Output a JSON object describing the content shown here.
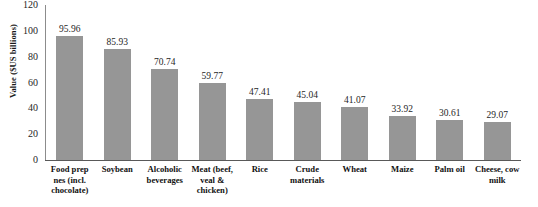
{
  "chart_data": {
    "type": "bar",
    "title": "",
    "xlabel": "",
    "ylabel": "Value ($US billions)",
    "ylim": [
      0,
      120
    ],
    "yticks": [
      "0",
      "20",
      "40",
      "60",
      "80",
      "100",
      "120"
    ],
    "grid": false,
    "legend": "none",
    "bar_color": "#969696",
    "axis_color": "#8c8c8c",
    "categories": [
      "Food prep nes (incl. chocolate)",
      "Soybean",
      "Alcoholic beverages",
      "Meat (beef, veal & chicken)",
      "Rice",
      "Crude materials",
      "Wheat",
      "Maize",
      "Palm oil",
      "Cheese, cow milk"
    ],
    "values": [
      95.96,
      85.93,
      70.74,
      59.77,
      47.41,
      45.04,
      41.07,
      33.92,
      30.61,
      29.07
    ],
    "value_labels": [
      "95.96",
      "85.93",
      "70.74",
      "59.77",
      "47.41",
      "45.04",
      "41.07",
      "33.92",
      "30.61",
      "29.07"
    ]
  }
}
